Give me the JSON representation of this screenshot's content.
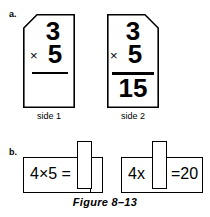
{
  "figure": {
    "caption": "Figure 8–13"
  },
  "parts": {
    "a": {
      "label": "a.",
      "cards": [
        {
          "caption": "side 1",
          "corner_cut": "top-left",
          "top_number": "3",
          "operator": "×",
          "bottom_number": "5",
          "rule": true,
          "answer": ""
        },
        {
          "caption": "side 2",
          "corner_cut": "top-right",
          "top_number": "3",
          "operator": "×",
          "bottom_number": "5",
          "rule": true,
          "answer": "15"
        }
      ]
    },
    "b": {
      "label": "b.",
      "strips": [
        {
          "name": "slider-strip-left",
          "visible_text": "4×5 =",
          "slider_position": "right",
          "hidden_text": ""
        },
        {
          "name": "slider-strip-right",
          "visible_text_left": "4x",
          "visible_text_right": "=20",
          "slider_position": "middle"
        }
      ]
    }
  },
  "colors": {
    "ink": "#000000",
    "paper": "#ffffff"
  }
}
